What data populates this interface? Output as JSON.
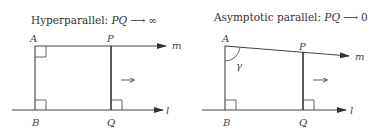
{
  "left_diagram": {
    "title_prefix": "Hyperparallel: ",
    "title_var": "PQ",
    "title_arrow": "⟶",
    "title_limit": "∞",
    "labels": {
      "A": "A",
      "P": "P",
      "B": "B",
      "Q": "Q",
      "m": "m",
      "l": "l"
    },
    "direction_arrow": "→"
  },
  "right_diagram": {
    "title_prefix": "Asymptotic parallel: ",
    "title_var": "PQ",
    "title_arrow": "⟶",
    "title_limit": "0",
    "labels": {
      "A": "A",
      "P": "P",
      "B": "B",
      "Q": "Q",
      "m": "m",
      "l": "l",
      "gamma": "γ"
    },
    "direction_arrow": "→"
  },
  "colors": {
    "line": "#444444",
    "text": "#333333",
    "background": "#ffffff"
  }
}
